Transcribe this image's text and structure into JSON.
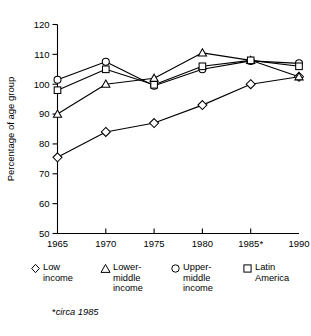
{
  "chart_data": {
    "type": "line",
    "title": "",
    "xlabel": "",
    "ylabel": "Percentage of age group",
    "x": [
      "1965",
      "1970",
      "1975",
      "1980",
      "1985*",
      "1990"
    ],
    "xlim": [
      1965,
      1990
    ],
    "ylim": [
      50,
      120
    ],
    "yticks": [
      50,
      60,
      70,
      80,
      90,
      100,
      110,
      120
    ],
    "grid": false,
    "legend_position": "below",
    "series": [
      {
        "name": "Low income",
        "marker": "diamond",
        "values": [
          75.5,
          84.0,
          87.0,
          93.0,
          100.0,
          102.5
        ]
      },
      {
        "name": "Lower-middle income",
        "marker": "triangle",
        "values": [
          90.0,
          100.0,
          102.0,
          110.5,
          108.0,
          102.5
        ]
      },
      {
        "name": "Upper-middle income",
        "marker": "circle",
        "values": [
          101.5,
          107.5,
          99.5,
          105.0,
          107.8,
          107.0
        ]
      },
      {
        "name": "Latin America",
        "marker": "square",
        "values": [
          98.0,
          105.0,
          99.8,
          106.0,
          108.0,
          106.0
        ]
      }
    ],
    "annotations": [
      "*circa 1985"
    ]
  },
  "axis": {
    "y_title": "Percentage of age group",
    "y_ticklabels": [
      "120",
      "110",
      "100",
      "90",
      "80",
      "70",
      "60",
      "50"
    ],
    "x_ticklabels": [
      "1965",
      "1970",
      "1975",
      "1980",
      "1985*",
      "1990"
    ]
  },
  "legend": {
    "items": [
      {
        "glyph": "diamond-marker-icon",
        "label": "Low\nincome"
      },
      {
        "glyph": "triangle-marker-icon",
        "label": "Lower-\nmiddle\nincome"
      },
      {
        "glyph": "circle-marker-icon",
        "label": "Upper-\nmiddle\nincome"
      },
      {
        "glyph": "square-marker-icon",
        "label": "Latin\nAmerica"
      }
    ]
  },
  "footnote": {
    "star": "*",
    "text": "circa 1985"
  },
  "colors": {
    "ink": "#000000",
    "background": "#ffffff",
    "marker_fill": "#ffffff"
  }
}
